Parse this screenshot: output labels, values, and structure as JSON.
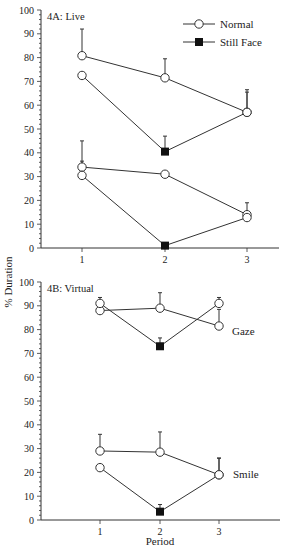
{
  "chart_data": [
    {
      "type": "line",
      "panel": "4A: Live",
      "title": "4A: Live",
      "xlabel": "",
      "ylabel": "% Duration",
      "ylim": [
        0,
        100
      ],
      "yticks": [
        0,
        10,
        20,
        30,
        40,
        50,
        60,
        70,
        80,
        90,
        100
      ],
      "categories": [
        1,
        2,
        3
      ],
      "legend": [
        {
          "label": "Normal",
          "marker": "open-circle"
        },
        {
          "label": "Still Face",
          "marker": "filled-square"
        }
      ],
      "legend_position": "top-right",
      "series": [
        {
          "name": "Upper A",
          "values": [
            80.8,
            71.5,
            57.0
          ],
          "markers": [
            "open-circle",
            "open-circle",
            "open-circle"
          ],
          "error_top": [
            92.0,
            79.5,
            66.5
          ]
        },
        {
          "name": "Upper B",
          "values": [
            72.5,
            40.5,
            57.0
          ],
          "markers": [
            "open-circle",
            "filled-square",
            "open-circle"
          ],
          "error_top": [
            null,
            47.0,
            65.5
          ]
        },
        {
          "name": "Lower A",
          "values": [
            34.0,
            31.0,
            14.0
          ],
          "markers": [
            "open-circle",
            "open-circle",
            "open-circle"
          ],
          "error_top": [
            45.0,
            null,
            19.0
          ]
        },
        {
          "name": "Lower B",
          "values": [
            30.5,
            1.0,
            12.8
          ],
          "markers": [
            "open-circle",
            "filled-square",
            "open-circle"
          ],
          "error_top": [
            36.5,
            null,
            null
          ]
        }
      ]
    },
    {
      "type": "line",
      "panel": "4B: Virtual",
      "title": "4B: Virtual",
      "xlabel": "Period",
      "ylabel": "% Duration",
      "ylim": [
        0,
        100
      ],
      "yticks": [
        0,
        10,
        20,
        30,
        40,
        50,
        60,
        70,
        80,
        90,
        100
      ],
      "categories": [
        1,
        2,
        3
      ],
      "annotations": [
        "Gaze",
        "Smile"
      ],
      "series": [
        {
          "name": "Gaze A",
          "values": [
            88.0,
            89.0,
            81.5
          ],
          "markers": [
            "open-circle",
            "open-circle",
            "open-circle"
          ],
          "error_top": [
            null,
            95.5,
            88.5
          ]
        },
        {
          "name": "Gaze B",
          "values": [
            91.0,
            73.0,
            91.0
          ],
          "markers": [
            "open-circle",
            "filled-square",
            "open-circle"
          ],
          "error_top": [
            93.5,
            76.5,
            93.5
          ]
        },
        {
          "name": "Smile A",
          "values": [
            29.0,
            28.5,
            19.0
          ],
          "markers": [
            "open-circle",
            "open-circle",
            "open-circle"
          ],
          "error_top": [
            36.0,
            37.0,
            26.0
          ]
        },
        {
          "name": "Smile B",
          "values": [
            22.0,
            3.5,
            19.0
          ],
          "markers": [
            "open-circle",
            "filled-square",
            "open-circle"
          ],
          "error_top": [
            null,
            6.5,
            26.0
          ]
        }
      ]
    }
  ],
  "labels": {
    "panel_a": "4A: Live",
    "panel_b": "4B: Virtual",
    "y_axis": "% Duration",
    "x_axis": "Period",
    "legend_normal": "Normal",
    "legend_still_face": "Still Face",
    "gaze": "Gaze",
    "smile": "Smile",
    "x_ticks": [
      "1",
      "2",
      "3"
    ],
    "y_ticks": [
      "0",
      "10",
      "20",
      "30",
      "40",
      "50",
      "60",
      "70",
      "80",
      "90",
      "100"
    ]
  }
}
